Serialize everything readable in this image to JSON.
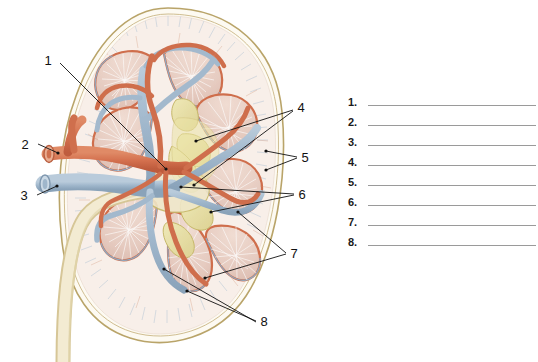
{
  "figure": {
    "type": "anatomical-diagram",
    "background_color": "#ffffff",
    "callouts": [
      {
        "id": "callout-1",
        "number": "1",
        "x": 48,
        "y": 65,
        "leader_count": 1
      },
      {
        "id": "callout-2",
        "number": "2",
        "x": 25,
        "y": 145,
        "leader_count": 1
      },
      {
        "id": "callout-3",
        "number": "3",
        "x": 24,
        "y": 196,
        "leader_count": 1
      },
      {
        "id": "callout-4",
        "number": "4",
        "x": 299,
        "y": 108,
        "leader_count": 2
      },
      {
        "id": "callout-5",
        "number": "5",
        "x": 303,
        "y": 158,
        "leader_count": 2
      },
      {
        "id": "callout-6",
        "number": "6",
        "x": 300,
        "y": 196,
        "leader_count": 2
      },
      {
        "id": "callout-7",
        "number": "7",
        "x": 292,
        "y": 255,
        "leader_count": 2
      },
      {
        "id": "callout-8",
        "number": "8",
        "x": 262,
        "y": 323,
        "leader_count": 2
      }
    ],
    "colors": {
      "capsule": "#b9a469",
      "cortex": "#f6ece6",
      "pyramid": "#e6cbc0",
      "artery": "#d4714f",
      "vein": "#9fb6cb",
      "calyx": "#e8e0a8",
      "ureter": "#efe7c8",
      "striation": "#c9d3df",
      "leader": "#111111"
    }
  },
  "answer_list": {
    "name": "numbered-answer-lines",
    "items": [
      {
        "number": "1."
      },
      {
        "number": "2."
      },
      {
        "number": "3."
      },
      {
        "number": "4."
      },
      {
        "number": "5."
      },
      {
        "number": "6."
      },
      {
        "number": "7."
      },
      {
        "number": "8."
      }
    ]
  }
}
